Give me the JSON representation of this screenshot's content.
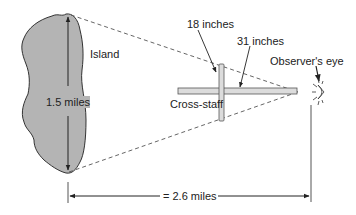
{
  "diagram": {
    "labels": {
      "island": "Island",
      "island_height": "1.5 miles",
      "crossbar_length": "18 inches",
      "staff_length": "31 inches",
      "cross_staff": "Cross-staff",
      "observer": "Observer's eye",
      "distance": "= 2.6 miles"
    },
    "colors": {
      "island_fill": "#b4b4b4",
      "outline": "#333333",
      "staff_fill": "#dcdcdc",
      "dash": "#555555"
    }
  }
}
